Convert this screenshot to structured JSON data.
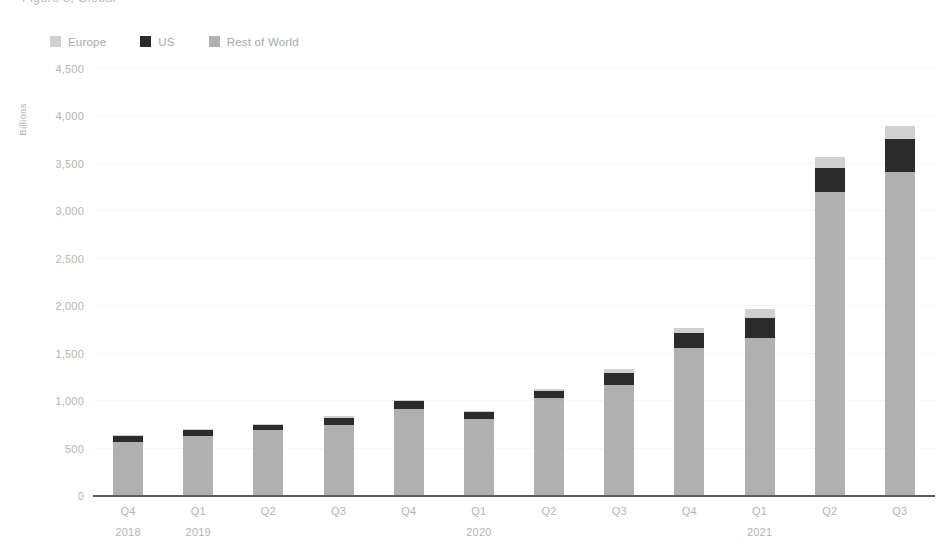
{
  "title": "Figure 3, Global",
  "legend": {
    "position": "top-left",
    "items": [
      {
        "label": "Europe",
        "color": "#d0d0d0"
      },
      {
        "label": "US",
        "color": "#2b2b2b"
      },
      {
        "label": "Rest of World",
        "color": "#b0b0b0"
      }
    ]
  },
  "axis": {
    "y_title": "Billions",
    "y_ticks": [
      "4,500",
      "4,000",
      "3,500",
      "3,000",
      "2,500",
      "2,000",
      "1,500",
      "1,000",
      "500",
      "0"
    ]
  },
  "colors": {
    "europe": "#d0d0d0",
    "us": "#2b2b2b",
    "rest_of_world": "#b0b0b0",
    "gridline": "#efefef",
    "baseline": "#5c5c5c",
    "text": "#b4b4b4"
  },
  "chart_data": {
    "type": "bar",
    "stacked": true,
    "title": "Figure 3, Global",
    "xlabel": "",
    "ylabel": "Billions",
    "ylim": [
      0,
      4500
    ],
    "ytick_step": 500,
    "grid": true,
    "legend_position": "top-left",
    "categories": [
      {
        "quarter": "Q4",
        "year": "2018"
      },
      {
        "quarter": "Q1",
        "year": "2019"
      },
      {
        "quarter": "Q2",
        "year": ""
      },
      {
        "quarter": "Q3",
        "year": ""
      },
      {
        "quarter": "Q4",
        "year": ""
      },
      {
        "quarter": "Q1",
        "year": "2020"
      },
      {
        "quarter": "Q2",
        "year": ""
      },
      {
        "quarter": "Q3",
        "year": ""
      },
      {
        "quarter": "Q4",
        "year": ""
      },
      {
        "quarter": "Q1",
        "year": "2021"
      },
      {
        "quarter": "Q2",
        "year": ""
      },
      {
        "quarter": "Q3",
        "year": ""
      }
    ],
    "series": [
      {
        "name": "Rest of World",
        "color": "#b0b0b0",
        "values": [
          560,
          625,
          680,
          740,
          905,
          805,
          1020,
          1160,
          1550,
          1650,
          3190,
          3400
        ]
      },
      {
        "name": "US",
        "color": "#2b2b2b",
        "values": [
          60,
          65,
          60,
          75,
          85,
          65,
          75,
          130,
          160,
          220,
          260,
          350
        ]
      },
      {
        "name": "Europe",
        "color": "#d0d0d0",
        "values": [
          10,
          10,
          10,
          15,
          15,
          15,
          25,
          35,
          55,
          95,
          115,
          135
        ]
      }
    ],
    "totals": [
      630,
      700,
      750,
      830,
      1005,
      885,
      1120,
      1325,
      1765,
      1965,
      3565,
      3885
    ]
  }
}
